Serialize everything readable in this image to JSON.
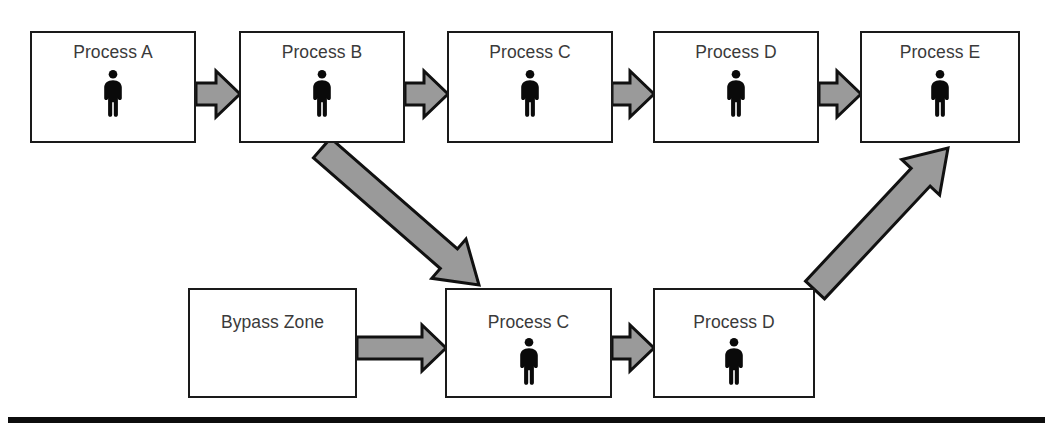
{
  "diagram": {
    "colors": {
      "box_border": "#1a1a1a",
      "box_fill": "#ffffff",
      "arrow_fill": "#9a9a9a",
      "arrow_stroke": "#111111",
      "label_text": "#3a3a3a",
      "baseline": "#0d0d0d",
      "person_icon": "#0a0a0a"
    },
    "top_row": {
      "name": "main-process-lane",
      "boxes": [
        {
          "id": "top-process-a",
          "label": "Process A",
          "has_person": true,
          "x": 30,
          "y": 31,
          "w": 166,
          "h": 112
        },
        {
          "id": "top-process-b",
          "label": "Process B",
          "has_person": true,
          "x": 239,
          "y": 31,
          "w": 166,
          "h": 112
        },
        {
          "id": "top-process-c",
          "label": "Process C",
          "has_person": true,
          "x": 447,
          "y": 31,
          "w": 166,
          "h": 112
        },
        {
          "id": "top-process-d",
          "label": "Process D",
          "has_person": true,
          "x": 653,
          "y": 31,
          "w": 166,
          "h": 112
        },
        {
          "id": "top-process-e",
          "label": "Process E",
          "has_person": true,
          "x": 860,
          "y": 31,
          "w": 160,
          "h": 112
        }
      ]
    },
    "bottom_row": {
      "name": "bypass-lane",
      "boxes": [
        {
          "id": "bottom-bypass-zone",
          "label": "Bypass Zone",
          "has_person": false,
          "x": 188,
          "y": 288,
          "w": 169,
          "h": 110
        },
        {
          "id": "bottom-process-c",
          "label": "Process C",
          "has_person": true,
          "x": 445,
          "y": 288,
          "w": 167,
          "h": 110
        },
        {
          "id": "bottom-process-d",
          "label": "Process D",
          "has_person": true,
          "x": 653,
          "y": 288,
          "w": 162,
          "h": 110
        }
      ]
    },
    "arrows": [
      {
        "id": "arrow-a-to-b",
        "kind": "horizontal",
        "from": "top-process-a",
        "to": "top-process-b",
        "x1": 196,
        "y1": 94,
        "x2": 240,
        "y2": 94
      },
      {
        "id": "arrow-b-to-c",
        "kind": "horizontal",
        "from": "top-process-b",
        "to": "top-process-c",
        "x1": 405,
        "y1": 94,
        "x2": 448,
        "y2": 94
      },
      {
        "id": "arrow-c-to-d",
        "kind": "horizontal",
        "from": "top-process-c",
        "to": "top-process-d",
        "x1": 612,
        "y1": 94,
        "x2": 654,
        "y2": 94
      },
      {
        "id": "arrow-d-to-e",
        "kind": "horizontal",
        "from": "top-process-d",
        "to": "top-process-e",
        "x1": 819,
        "y1": 94,
        "x2": 861,
        "y2": 94
      },
      {
        "id": "arrow-bypass-to-process-c",
        "kind": "horizontal",
        "from": "bottom-bypass-zone",
        "to": "bottom-process-c",
        "x1": 357,
        "y1": 348,
        "x2": 446,
        "y2": 348
      },
      {
        "id": "arrow-bottom-c-to-d",
        "kind": "horizontal",
        "from": "bottom-process-c",
        "to": "bottom-process-d",
        "x1": 612,
        "y1": 348,
        "x2": 654,
        "y2": 348
      },
      {
        "id": "arrow-b-down-to-bottom-c",
        "kind": "diagonal-down-right",
        "from": "top-process-b",
        "to": "bottom-process-c",
        "x1": 322,
        "y1": 148,
        "x2": 479,
        "y2": 285
      },
      {
        "id": "arrow-bottom-d-up-to-e",
        "kind": "diagonal-up-right",
        "from": "bottom-process-d",
        "to": "top-process-e",
        "x1": 815,
        "y1": 290,
        "x2": 948,
        "y2": 148
      }
    ],
    "baseline": {
      "id": "baseline-rule",
      "x": 8,
      "y": 417,
      "w": 1037,
      "h": 6
    }
  }
}
